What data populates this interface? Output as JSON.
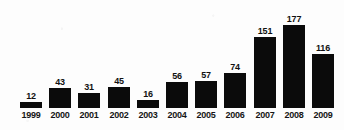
{
  "chart_data": {
    "type": "bar",
    "title": "",
    "subtitle": "",
    "xlabel": "",
    "ylabel": "",
    "categories": [
      "1999",
      "2000",
      "2001",
      "2002",
      "2003",
      "2004",
      "2005",
      "2006",
      "2007",
      "2008",
      "2009"
    ],
    "values": [
      12,
      43,
      31,
      45,
      16,
      56,
      57,
      74,
      151,
      177,
      116
    ],
    "value_labels": [
      "12",
      "43",
      "31",
      "45",
      "16",
      "56",
      "57",
      "74",
      "151",
      "177",
      "116"
    ],
    "ylim": [
      0,
      177
    ],
    "grid": false,
    "legend": null,
    "legend_position": "none",
    "axis_line": false,
    "bar_color": "#0b0b0b",
    "background_color": "#fdfdfd",
    "label_color": "#111111",
    "data_labels_shown": true
  }
}
